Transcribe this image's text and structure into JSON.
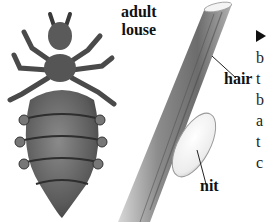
{
  "figure": {
    "labels": {
      "adult_louse_line1": "adult",
      "adult_louse_line2": "louse",
      "hair": "hair",
      "nit": "nit"
    },
    "colors": {
      "louse_body": "#6a6a6a",
      "louse_dark": "#3c3c3c",
      "hair_shaft": "#8a8a8a",
      "nit": "#f2f2f2",
      "text": "#111111"
    }
  },
  "side_text": {
    "arrow_icon": "right-triangle-arrow",
    "lines": [
      "b",
      "t",
      "b",
      "a",
      "t",
      "c"
    ]
  }
}
